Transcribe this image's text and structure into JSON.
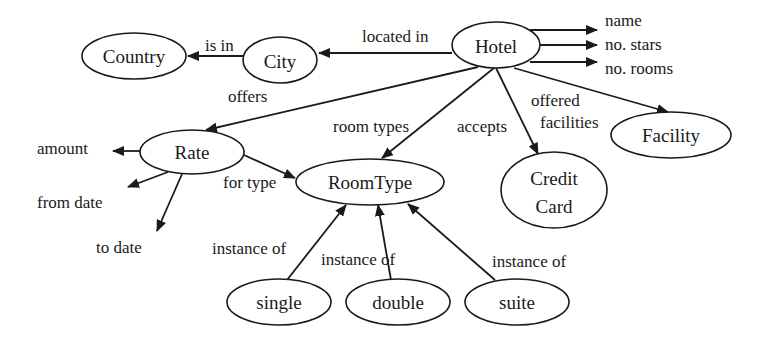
{
  "diagram": {
    "type": "semantic-network",
    "nodes": [
      {
        "id": "country",
        "label": "Country",
        "cx": 134,
        "cy": 56,
        "rx": 52,
        "ry": 23
      },
      {
        "id": "city",
        "label": "City",
        "cx": 280,
        "cy": 60,
        "rx": 37,
        "ry": 23
      },
      {
        "id": "hotel",
        "label": "Hotel",
        "cx": 496,
        "cy": 45,
        "rx": 44,
        "ry": 23
      },
      {
        "id": "rate",
        "label": "Rate",
        "cx": 192,
        "cy": 152,
        "rx": 52,
        "ry": 22
      },
      {
        "id": "roomtype",
        "label": "RoomType",
        "cx": 370,
        "cy": 182,
        "rx": 74,
        "ry": 23
      },
      {
        "id": "creditcard",
        "label": [
          "Credit",
          "Card"
        ],
        "cx": 554,
        "cy": 190,
        "rx": 53,
        "ry": 38
      },
      {
        "id": "facility",
        "label": "Facility",
        "cx": 671,
        "cy": 135,
        "rx": 60,
        "ry": 23
      },
      {
        "id": "single",
        "label": "single",
        "cx": 279,
        "cy": 302,
        "rx": 52,
        "ry": 23
      },
      {
        "id": "double",
        "label": "double",
        "cx": 398,
        "cy": 302,
        "rx": 52,
        "ry": 23
      },
      {
        "id": "suite",
        "label": "suite",
        "cx": 517,
        "cy": 302,
        "rx": 52,
        "ry": 23
      }
    ],
    "edges": [
      {
        "from": "city",
        "to": "country",
        "label": "is in"
      },
      {
        "from": "hotel",
        "to": "city",
        "label": "located in"
      },
      {
        "from": "hotel",
        "to": "rate",
        "label": "offers"
      },
      {
        "from": "hotel",
        "to": "roomtype",
        "label": "room types"
      },
      {
        "from": "hotel",
        "to": "creditcard",
        "label": "accepts"
      },
      {
        "from": "hotel",
        "to": "facility",
        "label": [
          "offered",
          "facilities"
        ]
      },
      {
        "from": "rate",
        "to": "roomtype",
        "label": "for type"
      },
      {
        "from": "single",
        "to": "roomtype",
        "label": "instance of"
      },
      {
        "from": "double",
        "to": "roomtype",
        "label": "instance of"
      },
      {
        "from": "suite",
        "to": "roomtype",
        "label": "instance of"
      }
    ],
    "attributes": {
      "hotel": [
        "name",
        "no. stars",
        "no. rooms"
      ],
      "rate": [
        "amount",
        "from date",
        "to date"
      ]
    },
    "labels": {
      "nodes": {
        "country": "Country",
        "city": "City",
        "hotel": "Hotel",
        "rate": "Rate",
        "roomtype": "RoomType",
        "creditcard_line1": "Credit",
        "creditcard_line2": "Card",
        "facility": "Facility",
        "single": "single",
        "double": "double",
        "suite": "suite"
      },
      "edges": {
        "is_in": "is in",
        "located_in": "located in",
        "offers": "offers",
        "room_types": "room types",
        "accepts": "accepts",
        "offered_facilities_line1": "offered",
        "offered_facilities_line2": "facilities",
        "for_type": "for type",
        "instance_of_single": "instance of",
        "instance_of_double": "instance of",
        "instance_of_suite": "instance of"
      },
      "attributes": {
        "hotel_name": "name",
        "hotel_stars": "no. stars",
        "hotel_rooms": "no. rooms",
        "rate_amount": "amount",
        "rate_from": "from date",
        "rate_to": "to date"
      }
    },
    "colors": {
      "stroke": "#1a1a1a",
      "background": "#ffffff"
    }
  }
}
